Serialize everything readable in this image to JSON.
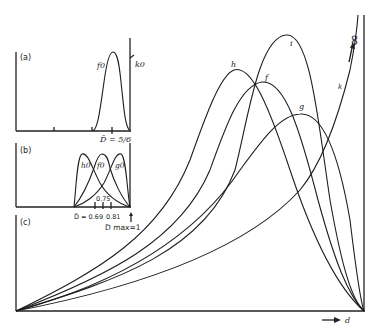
{
  "panels": {
    "a": {
      "label": "(a)",
      "curve_label": "f0",
      "right_label": "k0",
      "mean_label": "D̄ = 5/6"
    },
    "b": {
      "label": "(b)",
      "curve_labels": [
        "h0",
        "f0",
        "g0"
      ],
      "tick_label_top": "0.75",
      "mean_label": "D̄ = 0.69",
      "tick_label_right": "0.81",
      "dmax_label": "D max=1"
    },
    "c": {
      "label": "(c)",
      "curve_labels": [
        "h",
        "f",
        "i",
        "g",
        "k"
      ],
      "infinity_label": "∞",
      "x_axis_label": "d"
    }
  },
  "colors": {
    "ink": "#1e1e1e",
    "background": "#ffffff"
  }
}
